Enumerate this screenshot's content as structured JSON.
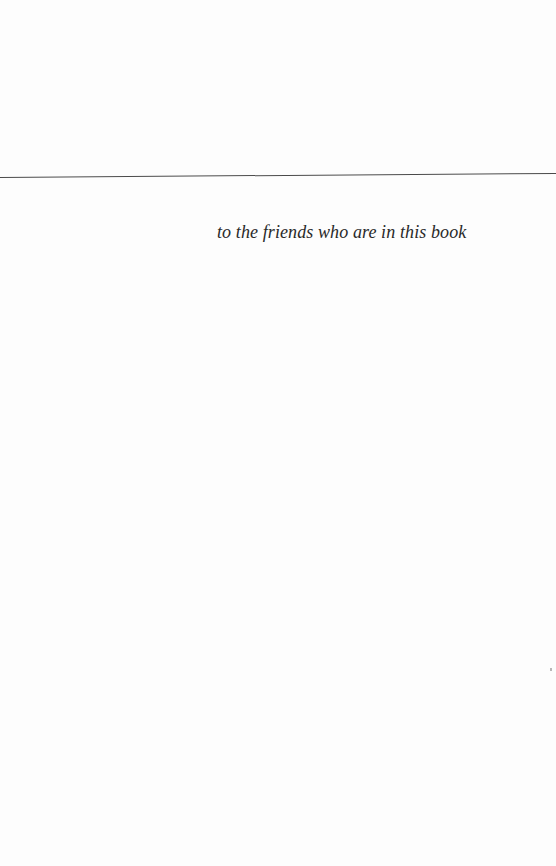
{
  "page": {
    "dedication": "to the friends who are in this book",
    "background_color": "#fdfdfd",
    "rule_color": "#4a4a4a"
  }
}
